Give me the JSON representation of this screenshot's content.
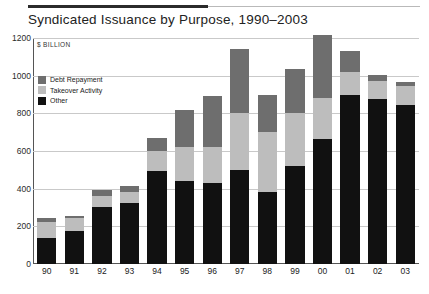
{
  "figure": {
    "title": "Syndicated Issuance by Purpose, 1990–2003",
    "unit_label": "$ BILLION"
  },
  "legend": {
    "items": [
      {
        "label": "Debt Repayment",
        "color": "#6e6e6e"
      },
      {
        "label": "Takeover Activity",
        "color": "#bdbdbd"
      },
      {
        "label": "Other",
        "color": "#111111"
      }
    ]
  },
  "chart_data": {
    "type": "bar",
    "stacked": true,
    "title": "Syndicated Issuance by Purpose, 1990–2003",
    "xlabel": "",
    "ylabel": "$ BILLION",
    "ylim": [
      0,
      1200
    ],
    "yticks": [
      0,
      200,
      400,
      600,
      800,
      1000,
      1200
    ],
    "ytick_labels": [
      "0",
      "200",
      "400",
      "600",
      "800",
      "1000",
      "1200"
    ],
    "grid": true,
    "legend_position": "upper-left-inside",
    "categories": [
      "90",
      "91",
      "92",
      "93",
      "94",
      "95",
      "96",
      "97",
      "98",
      "99",
      "00",
      "01",
      "02",
      "03"
    ],
    "series": [
      {
        "name": "Other",
        "color": "#111111",
        "values": [
          140,
          175,
          305,
          325,
          495,
          440,
          430,
          500,
          380,
          520,
          665,
          900,
          875,
          845
        ]
      },
      {
        "name": "Takeover Activity",
        "color": "#bdbdbd",
        "values": [
          85,
          70,
          55,
          55,
          105,
          180,
          190,
          300,
          320,
          280,
          215,
          120,
          95,
          100
        ]
      },
      {
        "name": "Debt Repayment",
        "color": "#6e6e6e",
        "values": [
          20,
          10,
          35,
          35,
          70,
          200,
          270,
          340,
          195,
          235,
          335,
          110,
          35,
          20
        ]
      }
    ],
    "totals": [
      245,
      255,
      395,
      415,
      670,
      820,
      890,
      1140,
      895,
      1035,
      1215,
      1130,
      1005,
      965
    ]
  }
}
